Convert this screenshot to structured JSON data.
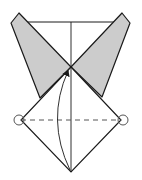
{
  "diagram": {
    "colors": {
      "paper": "#ffffff",
      "shade": "#cccccc",
      "line": "#1a1a1a",
      "dash": "#555555",
      "circle": "#555555"
    },
    "elements": [
      {
        "name": "left-flap",
        "type": "shaded-polygon"
      },
      {
        "name": "right-flap",
        "type": "shaded-polygon"
      },
      {
        "name": "top-edge",
        "type": "line"
      },
      {
        "name": "center-crease",
        "type": "line"
      },
      {
        "name": "diamond",
        "type": "polygon"
      },
      {
        "name": "valley-fold-line",
        "type": "dashed-line"
      },
      {
        "name": "left-reference-circle",
        "type": "circle"
      },
      {
        "name": "right-reference-circle",
        "type": "circle"
      },
      {
        "name": "fold-arrow",
        "type": "curved-arrow"
      }
    ]
  }
}
